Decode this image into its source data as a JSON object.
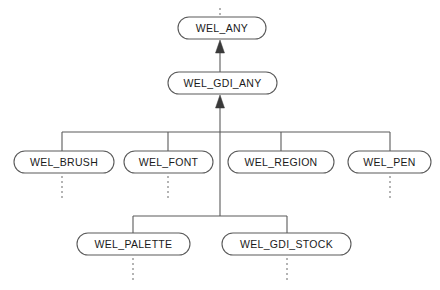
{
  "diagram": {
    "type": "inheritance-tree",
    "colors": {
      "node_stroke": "#5a5a5a",
      "node_fill": "#ffffff",
      "edge": "#5a5a5a",
      "dashed_edge": "#777777",
      "arrow": "#3a3a3a",
      "label_text": "#1a1a1a",
      "background": "#ffffff"
    },
    "nodes": [
      {
        "id": "wel_any",
        "label": "WEL_ANY",
        "x": 178,
        "y": 17,
        "width": 88,
        "height": 22,
        "level": 0
      },
      {
        "id": "wel_gdi_any",
        "label": "WEL_GDI_ANY",
        "x": 168,
        "y": 72,
        "width": 109,
        "height": 22,
        "level": 1
      },
      {
        "id": "wel_brush",
        "label": "WEL_BRUSH",
        "x": 14,
        "y": 151,
        "width": 100,
        "height": 22,
        "level": 2
      },
      {
        "id": "wel_font",
        "label": "WEL_FONT",
        "x": 124,
        "y": 151,
        "width": 89,
        "height": 22,
        "level": 2
      },
      {
        "id": "wel_region",
        "label": "WEL_REGION",
        "x": 228,
        "y": 151,
        "width": 106,
        "height": 22,
        "level": 2
      },
      {
        "id": "wel_pen",
        "label": "WEL_PEN",
        "x": 348,
        "y": 151,
        "width": 83,
        "height": 22,
        "level": 2
      },
      {
        "id": "wel_palette",
        "label": "WEL_PALETTE",
        "x": 77,
        "y": 233,
        "width": 113,
        "height": 22,
        "level": 3
      },
      {
        "id": "wel_gdi_stock",
        "label": "WEL_GDI_STOCK",
        "x": 222,
        "y": 233,
        "width": 129,
        "height": 22,
        "level": 3
      }
    ],
    "arrows": [
      {
        "id": "arrow-to-wel-any",
        "from": "wel_gdi_any",
        "to": "wel_any",
        "x": 220,
        "tail_y": 72,
        "head_y": 40
      },
      {
        "id": "arrow-to-wel-gdi-any",
        "from": "gdi-bus",
        "to": "wel_gdi_any",
        "x": 220,
        "tail_y": 216,
        "head_y": 95
      }
    ],
    "buses": [
      {
        "id": "gdi-subclass-bus",
        "y": 132,
        "x_start": 62,
        "x_end": 390,
        "drops": [
          62,
          168,
          281,
          390
        ]
      },
      {
        "id": "stock-subclass-bus",
        "y": 216,
        "x_start": 133,
        "x_end": 287,
        "drops": [
          133,
          287
        ]
      }
    ],
    "dashed_stubs": [
      {
        "id": "stub-above-wel-any",
        "x": 220,
        "y_start": 8,
        "y_end": 17
      },
      {
        "id": "stub-below-wel-brush",
        "x": 62,
        "y_start": 176,
        "y_end": 199
      },
      {
        "id": "stub-below-wel-font",
        "x": 168,
        "y_start": 176,
        "y_end": 199
      },
      {
        "id": "stub-below-wel-pen",
        "x": 390,
        "y_start": 176,
        "y_end": 199
      },
      {
        "id": "stub-below-wel-palette",
        "x": 133,
        "y_start": 258,
        "y_end": 281
      },
      {
        "id": "stub-below-wel-gdi-stock",
        "x": 287,
        "y_start": 258,
        "y_end": 281
      }
    ]
  }
}
